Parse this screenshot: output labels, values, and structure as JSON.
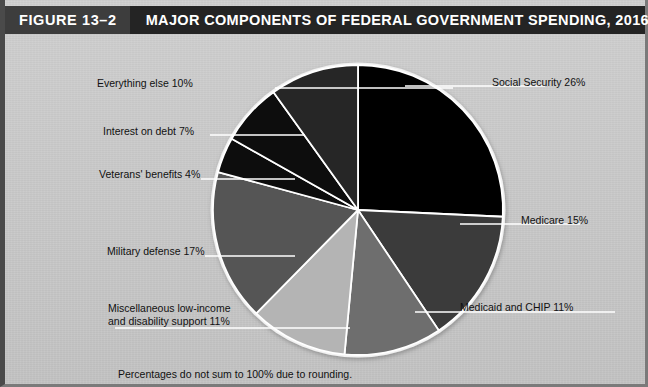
{
  "header": {
    "figure_number": "FIGURE 13–2",
    "title": "MAJOR COMPONENTS OF FEDERAL GOVERNMENT SPENDING, 2016",
    "bar_color": "#242424",
    "number_chip_color": "#3d3d3d",
    "text_color": "#ffffff"
  },
  "footnote": "Percentages do not sum to 100% due to rounding.",
  "background_color": "#c9c9c9",
  "chart_data": {
    "type": "pie",
    "title": "MAJOR COMPONENTS OF FEDERAL GOVERNMENT SPENDING, 2016",
    "xlabel": "",
    "ylabel": "",
    "legend": "labels-with-leader-lines",
    "grid": false,
    "note": "Percentages do not sum to 100% due to rounding.",
    "start_angle_deg": 0,
    "direction": "clockwise",
    "categories": [
      "Social Security",
      "Medicare",
      "Medicaid and CHIP",
      "Miscellaneous low-income and disability support",
      "Military defense",
      "Veterans' benefits",
      "Interest on debt",
      "Everything else"
    ],
    "values": [
      26,
      15,
      11,
      11,
      17,
      4,
      7,
      10
    ],
    "colors": [
      "#000000",
      "#3a3a3a",
      "#6e6e6e",
      "#b4b4b4",
      "#555555",
      "#0d0d0d",
      "#0a0a0a",
      "#262626"
    ],
    "slices": [
      {
        "label": "Social Security 26%",
        "name": "Social Security",
        "value": 26,
        "color": "#000000"
      },
      {
        "label": "Medicare 15%",
        "name": "Medicare",
        "value": 15,
        "color": "#3a3a3a"
      },
      {
        "label": "Medicaid and CHIP 11%",
        "name": "Medicaid and CHIP",
        "value": 11,
        "color": "#6e6e6e"
      },
      {
        "label": "Miscellaneous low-income and disability support 11%",
        "name": "Miscellaneous low-income and disability support",
        "value": 11,
        "color": "#b4b4b4"
      },
      {
        "label": "Military defense 17%",
        "name": "Military defense",
        "value": 17,
        "color": "#555555"
      },
      {
        "label": "Veterans' benefits 4%",
        "name": "Veterans' benefits",
        "value": 4,
        "color": "#0d0d0d"
      },
      {
        "label": "Interest on debt 7%",
        "name": "Interest on debt",
        "value": 7,
        "color": "#0a0a0a"
      },
      {
        "label": "Everything else 10%",
        "name": "Everything else",
        "value": 10,
        "color": "#262626"
      }
    ]
  },
  "labels": {
    "social_security": "Social Security 26%",
    "medicare": "Medicare 15%",
    "medicaid_chip": "Medicaid and CHIP 11%",
    "miscellaneous_line1": "Miscellaneous low-income",
    "miscellaneous_line2": "and disability support 11%",
    "military_defense": "Military defense 17%",
    "veterans_benefits": "Veterans' benefits 4%",
    "interest_on_debt": "Interest on debt 7%",
    "everything_else": "Everything else 10%"
  }
}
